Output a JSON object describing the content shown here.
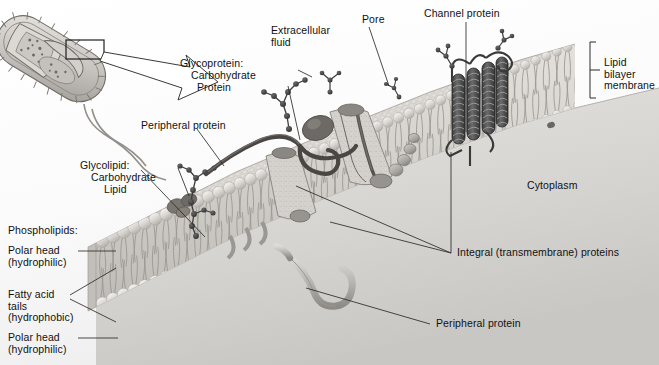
{
  "figure": {
    "background_color": "#ffffff",
    "text_color": "#111111",
    "line_color": "#3a3a3a"
  },
  "labels": {
    "extracellular_fluid": "Extracellular\nfluid",
    "pore": "Pore",
    "channel_protein": "Channel protein",
    "lipid_bilayer_membrane": "Lipid\nbilayer\nmembrane",
    "cytoplasm": "Cytoplasm",
    "glycoprotein_title": "Glycoprotein:",
    "glycoprotein_part1": "Carbohydrate",
    "glycoprotein_part2": "Protein",
    "glycolipid_title": "Glycolipid:",
    "glycolipid_part1": "Carbohydrate",
    "glycolipid_part2": "Lipid",
    "peripheral_protein_top": "Peripheral protein",
    "peripheral_protein_bottom": "Peripheral protein",
    "integral_proteins": "Integral (transmembrane) proteins",
    "phospholipids_title": "Phospholipids:",
    "polar_head_top": "Polar head\n(hydrophilic)",
    "fatty_acid_tails": "Fatty acid\ntails\n(hydrophobic)",
    "polar_head_bottom": "Polar head\n(hydrophilic)"
  },
  "structures": {
    "bacterium": "rod-shaped bacterial cell with pili and flagella, cutaway view",
    "callout_box": "small rectangle on bacterium surface marking magnified region",
    "callout_arrow": "large outlined arrow from bacterium to membrane detail",
    "membrane": "phospholipid bilayer shown in 3D perspective, cut away at left",
    "channel": "alpha-helical transmembrane channel protein bundle",
    "integral_protein": "globular protein spanning the bilayer with central pore",
    "carbohydrate_chains": "branched beaded oligosaccharide chains on outer surface",
    "peripheral_proteins": "tubular proteins attached to membrane surfaces"
  },
  "colors": {
    "membrane_head": "#cfcbc6",
    "membrane_fill": "#ddd9d4",
    "dark_protein": "#4a4a4a",
    "carbohydrate_bead": "#3c3c3c",
    "cytoplasm": "#d8d6d3",
    "outline": "#5a5a5a"
  }
}
